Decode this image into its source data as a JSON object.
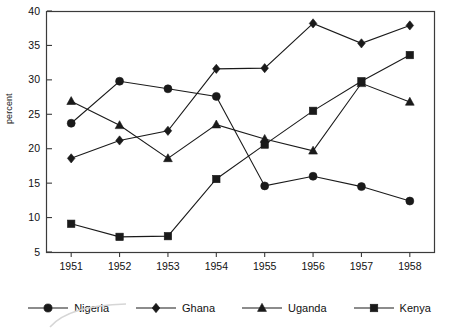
{
  "chart_data": {
    "type": "line",
    "title": "",
    "xlabel": "",
    "ylabel": "percent",
    "x": [
      "1951",
      "1952",
      "1953",
      "1954",
      "1955",
      "1956",
      "1957",
      "1958"
    ],
    "categories": [
      "1951",
      "1952",
      "1953",
      "1954",
      "1955",
      "1956",
      "1957",
      "1958"
    ],
    "xlim": [
      1951,
      1958
    ],
    "ylim": [
      5,
      40
    ],
    "ytick_labels": [
      "5",
      "10",
      "15",
      "20",
      "25",
      "30",
      "35",
      "40"
    ],
    "ytick_values": [
      5,
      10,
      15,
      20,
      25,
      30,
      35,
      40
    ],
    "grid": false,
    "legend_position": "bottom",
    "series": [
      {
        "name": "Nigeria",
        "marker": "circle",
        "values": [
          23.7,
          29.8,
          28.7,
          27.6,
          14.6,
          16.0,
          14.5,
          12.4
        ]
      },
      {
        "name": "Ghana",
        "marker": "diamond",
        "values": [
          18.6,
          21.2,
          22.6,
          31.6,
          31.7,
          38.2,
          35.3,
          37.9
        ]
      },
      {
        "name": "Uganda",
        "marker": "triangle",
        "values": [
          26.9,
          23.4,
          18.6,
          23.5,
          21.4,
          19.7,
          29.5,
          26.8
        ]
      },
      {
        "name": "Kenya",
        "marker": "square",
        "values": [
          9.1,
          7.2,
          7.3,
          15.6,
          20.6,
          25.5,
          29.8,
          33.6
        ]
      }
    ]
  },
  "legend": {
    "items": [
      {
        "label": "Nigeria",
        "marker": "circle"
      },
      {
        "label": "Ghana",
        "marker": "diamond"
      },
      {
        "label": "Uganda",
        "marker": "triangle"
      },
      {
        "label": "Kenya",
        "marker": "square"
      }
    ]
  },
  "colors": {
    "ink": "#1a1a1a",
    "frame": "#3b3b3b",
    "background": "#ffffff"
  }
}
